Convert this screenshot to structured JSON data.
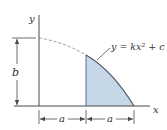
{
  "diagram": {
    "axis_labels": {
      "x": "x",
      "y": "y"
    },
    "equation": "y = kx² + c",
    "dimensions": {
      "height": "b",
      "left_width": "a",
      "right_width": "a"
    },
    "colors": {
      "line": "#4a4a4a",
      "fill": "#c6d8e8",
      "fill_stroke": "#5a6f86",
      "dash": "#888888"
    }
  }
}
